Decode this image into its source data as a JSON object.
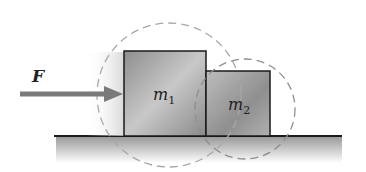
{
  "diagram": {
    "force_label": "F",
    "block1": {
      "label": "m",
      "subscript": "1"
    },
    "block2": {
      "label": "m",
      "subscript": "2"
    },
    "colors": {
      "arrow": "#7a7a7a",
      "block_fill": "#a8a8a8",
      "outline": "#1a1a1a",
      "dashed_circle": "#9a9a9a",
      "ground": "#b5b5b5"
    }
  }
}
